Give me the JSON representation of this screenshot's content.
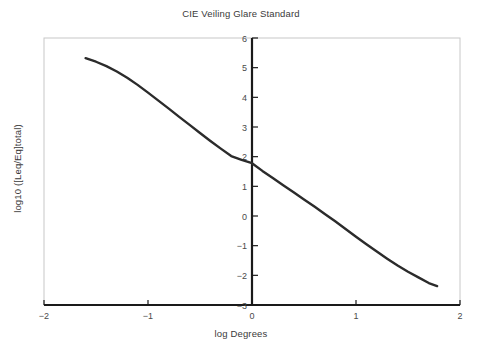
{
  "chart_data": {
    "type": "line",
    "title": "CIE Veiling Glare Standard",
    "xlabel": "log Degrees",
    "ylabel": "log10 ([Leq/Eq]total)",
    "xlim": [
      -2,
      2
    ],
    "ylim": [
      -3,
      6
    ],
    "grid": false,
    "legend": null,
    "line_color": "#2b2b2b",
    "axis_color": "#1a1a1a",
    "frame_color": "#c8c8c8",
    "xticks": [
      -2,
      -1,
      0,
      1,
      2
    ],
    "xtick_labels": [
      "−2",
      "−1",
      "0",
      "1",
      "2"
    ],
    "yticks": [
      -3,
      -2,
      -1,
      0,
      1,
      2,
      3,
      4,
      5,
      6
    ],
    "ytick_labels": [
      "−3",
      "−2",
      "−1",
      "0",
      "1",
      "2",
      "3",
      "4",
      "5",
      "6"
    ],
    "series": [
      {
        "name": "CIE veiling glare",
        "x": [
          -1.6,
          -1.5,
          -1.4,
          -1.3,
          -1.2,
          -1.1,
          -1.0,
          -0.9,
          -0.8,
          -0.7,
          -0.6,
          -0.5,
          -0.4,
          -0.3,
          -0.2,
          -0.1,
          0.0,
          0.1,
          0.2,
          0.3,
          0.4,
          0.5,
          0.6,
          0.7,
          0.8,
          0.9,
          1.0,
          1.1,
          1.2,
          1.3,
          1.4,
          1.5,
          1.6,
          1.7,
          1.78
        ],
        "y": [
          5.32,
          5.2,
          5.05,
          4.87,
          4.66,
          4.42,
          4.16,
          3.89,
          3.62,
          3.34,
          3.07,
          2.8,
          2.53,
          2.27,
          2.02,
          1.89,
          1.78,
          1.52,
          1.28,
          1.04,
          0.8,
          0.56,
          0.32,
          0.07,
          -0.18,
          -0.44,
          -0.7,
          -0.95,
          -1.2,
          -1.44,
          -1.67,
          -1.88,
          -2.07,
          -2.26,
          -2.36
        ]
      }
    ]
  },
  "axes": {
    "title": "CIE Veiling Glare Standard",
    "x_axis_label": "log Degrees",
    "y_axis_label": "log10 ([Leq/Eq]total)"
  }
}
